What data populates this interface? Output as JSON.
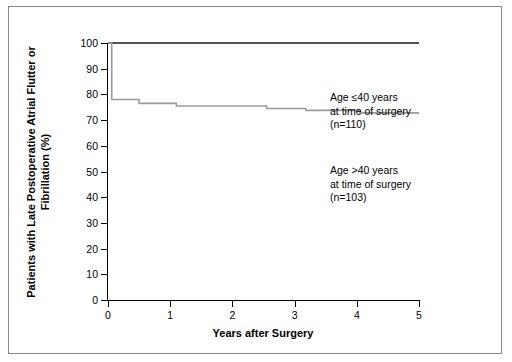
{
  "chart_data": {
    "type": "line",
    "title": "",
    "xlabel": "Years after Surgery",
    "ylabel": "Patients with Late Postoperative\nAtrial Flutter or Fibrillation (%)",
    "xlim": [
      0,
      5
    ],
    "ylim": [
      0,
      100
    ],
    "xticks": [
      "0",
      "1",
      "2",
      "3",
      "4",
      "5"
    ],
    "yticks": [
      "0",
      "10",
      "20",
      "30",
      "40",
      "50",
      "60",
      "70",
      "80",
      "90",
      "100"
    ],
    "grid": false,
    "legend_position": "inside-right",
    "series": [
      {
        "name": "Age ≤40 years at time of surgery (n=110)",
        "color": "#1a1a1a",
        "n": 110,
        "points": [
          {
            "x": 0,
            "y": 100
          },
          {
            "x": 5,
            "y": 100
          }
        ]
      },
      {
        "name": "Age >40 years at time of surgery (n=103)",
        "color": "#9a9a9a",
        "n": 103,
        "points": [
          {
            "x": 0,
            "y": 100
          },
          {
            "x": 0.06,
            "y": 78
          },
          {
            "x": 0.42,
            "y": 78
          },
          {
            "x": 0.5,
            "y": 76.5
          },
          {
            "x": 1.02,
            "y": 76.5
          },
          {
            "x": 1.1,
            "y": 75.5
          },
          {
            "x": 2.45,
            "y": 75.5
          },
          {
            "x": 2.55,
            "y": 74.5
          },
          {
            "x": 3.1,
            "y": 74.5
          },
          {
            "x": 3.18,
            "y": 73.8
          },
          {
            "x": 3.95,
            "y": 73.8
          },
          {
            "x": 4.05,
            "y": 72.8
          },
          {
            "x": 5,
            "y": 72.8
          }
        ]
      }
    ],
    "annotations": [
      {
        "id": "young",
        "lines": "Age ≤40 years\nat time of surgery\n(n=110)"
      },
      {
        "id": "old",
        "lines": "Age >40 years\nat time of surgery\n(n=103)"
      }
    ]
  }
}
